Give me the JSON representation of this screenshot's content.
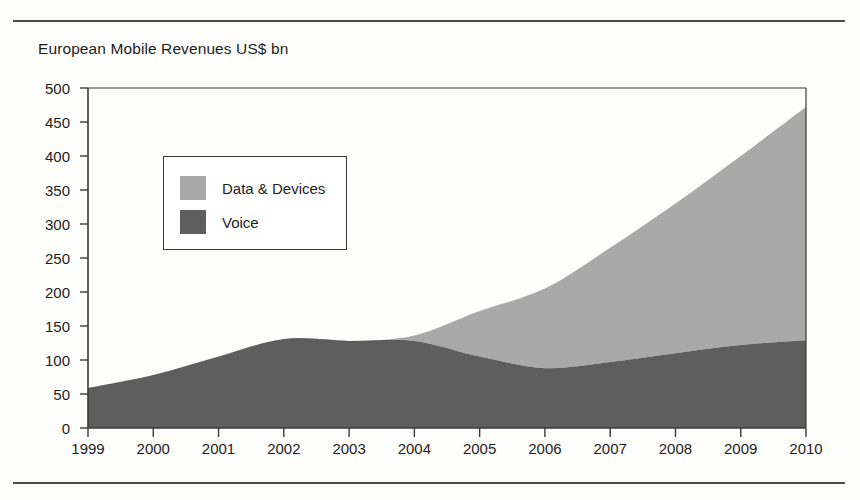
{
  "chart_data": {
    "type": "area",
    "title": "European Mobile Revenues US$ bn",
    "xlabel": "",
    "ylabel": "",
    "stacked": true,
    "grid": false,
    "legend_position": "inside-upper-left",
    "xlim": [
      1999,
      2010
    ],
    "ylim": [
      0,
      500
    ],
    "ytick_step": 50,
    "categories": [
      "1999",
      "2000",
      "2001",
      "2002",
      "2003",
      "2004",
      "2005",
      "2006",
      "2007",
      "2008",
      "2009",
      "2010"
    ],
    "x": [
      1999,
      2000,
      2001,
      2002,
      2003,
      2004,
      2005,
      2006,
      2007,
      2008,
      2009,
      2010
    ],
    "yticks": [
      0,
      50,
      100,
      150,
      200,
      250,
      300,
      350,
      400,
      450,
      500
    ],
    "series": [
      {
        "name": "Voice",
        "color": "#5e5e5e",
        "values": [
          59,
          78,
          105,
          131,
          128,
          128,
          105,
          88,
          97,
          110,
          122,
          129
        ]
      },
      {
        "name": "Data & Devices",
        "color": "#a9a9a9",
        "values": [
          0,
          0,
          0,
          0,
          0,
          8,
          67,
          117,
          168,
          220,
          278,
          343
        ]
      }
    ],
    "totals": [
      59,
      78,
      105,
      131,
      128,
      136,
      172,
      205,
      265,
      330,
      400,
      472
    ],
    "legend": [
      {
        "label": "Data & Devices",
        "color": "#a9a9a9"
      },
      {
        "label": "Voice",
        "color": "#5e5e5e"
      }
    ]
  },
  "figure": {
    "axis_color": "#3a3a3a",
    "rule_color": "#4a4a4a",
    "background": "#fdfdfc"
  }
}
